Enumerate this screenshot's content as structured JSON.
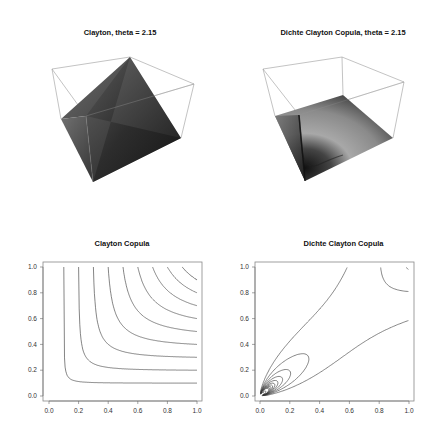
{
  "figure": {
    "layout": "2x2",
    "background": "#ffffff"
  },
  "chart_data": [
    {
      "id": "clayton-3d",
      "type": "surface3d",
      "title": "Clayton, theta = 2.15",
      "description": "Perspective 3D surface of the Clayton copula C(u,v) with theta = 2.15, shaded grayscale, drawn inside a wireframe box",
      "theta": 2.15,
      "axes_visible": false,
      "box": true
    },
    {
      "id": "clayton-density-3d",
      "type": "surface3d",
      "title": "Dichte Clayton Copula, theta = 2.15",
      "description": "Perspective 3D surface of the Clayton copula density with theta = 2.15; sharp peak near (0,0), flat elsewhere",
      "theta": 2.15,
      "axes_visible": false,
      "box": true
    },
    {
      "id": "clayton-contour",
      "type": "contour",
      "title": "Clayton Copula",
      "xlabel": "",
      "ylabel": "",
      "xlim": [
        0,
        1
      ],
      "ylim": [
        0,
        1
      ],
      "xticks": [
        "0.0",
        "0.2",
        "0.4",
        "0.6",
        "0.8",
        "1.0"
      ],
      "yticks": [
        "0.0",
        "0.2",
        "0.4",
        "0.6",
        "0.8",
        "1.0"
      ],
      "levels": [
        0.1,
        0.2,
        0.3,
        0.4,
        0.5,
        0.6,
        0.7,
        0.8,
        0.9
      ],
      "theta": 2.15
    },
    {
      "id": "clayton-density-contour",
      "type": "contour",
      "title": "Dichte Clayton Copula",
      "xlabel": "",
      "ylabel": "",
      "xlim": [
        0,
        1
      ],
      "ylim": [
        0,
        1
      ],
      "xticks": [
        "0.0",
        "0.2",
        "0.4",
        "0.6",
        "0.8",
        "1.0"
      ],
      "yticks": [
        "0.0",
        "0.2",
        "0.4",
        "0.6",
        "0.8",
        "1.0"
      ],
      "levels": [
        1,
        2,
        3,
        4,
        5,
        6,
        7,
        8,
        9,
        10,
        15,
        20
      ],
      "theta": 2.15
    }
  ]
}
